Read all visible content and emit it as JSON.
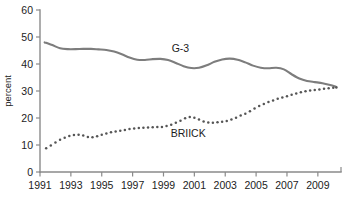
{
  "chart_data": {
    "type": "line",
    "title": "",
    "xlabel": "",
    "ylabel": "percent",
    "ylim": [
      0,
      60
    ],
    "xlim": [
      1991,
      2010.5
    ],
    "yticks": [
      0,
      10,
      20,
      30,
      40,
      50,
      60
    ],
    "ytick_labels": [
      "0",
      "10",
      "20",
      "30",
      "40",
      "50",
      "60"
    ],
    "xticks": [
      1991,
      1993,
      1995,
      1997,
      1999,
      2001,
      2003,
      2005,
      2007,
      2009
    ],
    "xtick_labels": [
      "1991",
      "1993",
      "1995",
      "1997",
      "1999",
      "2001",
      "2003",
      "2005",
      "2007",
      "2009"
    ],
    "grid": false,
    "legend_position": "inline-annotation",
    "series": [
      {
        "name": "G-3",
        "style": "solid-line",
        "color": "#7d7d7d",
        "label_x": 2000.1,
        "label_y": 44.5,
        "x": [
          1991.3,
          1991.8,
          1992.3,
          1992.8,
          1993.3,
          1993.8,
          1994.3,
          1994.8,
          1995.3,
          1995.8,
          1996.3,
          1996.8,
          1997.3,
          1997.8,
          1998.3,
          1998.8,
          1999.3,
          1999.8,
          2000.3,
          2000.8,
          2001.3,
          2001.8,
          2002.3,
          2002.8,
          2003.3,
          2003.8,
          2004.3,
          2004.8,
          2005.3,
          2005.8,
          2006.3,
          2006.8,
          2007.3,
          2007.8,
          2008.3,
          2008.8,
          2009.3,
          2009.8,
          2010.2
        ],
        "y": [
          48.0,
          47.0,
          45.8,
          45.5,
          45.5,
          45.6,
          45.6,
          45.4,
          45.2,
          44.6,
          43.6,
          42.4,
          41.6,
          41.5,
          41.8,
          41.9,
          41.5,
          40.4,
          39.2,
          38.5,
          38.6,
          39.5,
          40.8,
          41.7,
          42.0,
          41.6,
          40.6,
          39.4,
          38.6,
          38.4,
          38.6,
          38.0,
          36.2,
          34.6,
          33.7,
          33.3,
          32.9,
          32.2,
          31.5
        ]
      },
      {
        "name": "BRIICK",
        "style": "dotted",
        "color": "#555555",
        "label_x": 2000.6,
        "label_y": 12.8,
        "x": [
          1991.4,
          1991.7,
          1992.0,
          1992.3,
          1992.6,
          1992.9,
          1993.2,
          1993.5,
          1993.8,
          1994.1,
          1994.4,
          1994.7,
          1995.0,
          1995.3,
          1995.6,
          1995.9,
          1996.2,
          1996.5,
          1996.8,
          1997.1,
          1997.4,
          1997.7,
          1998.0,
          1998.3,
          1998.6,
          1998.9,
          1999.2,
          1999.5,
          1999.8,
          2000.1,
          2000.4,
          2000.7,
          2001.0,
          2001.3,
          2001.6,
          2001.9,
          2002.2,
          2002.5,
          2002.8,
          2003.1,
          2003.4,
          2003.7,
          2004.0,
          2004.3,
          2004.6,
          2004.9,
          2005.2,
          2005.5,
          2005.8,
          2006.1,
          2006.4,
          2006.7,
          2007.0,
          2007.3,
          2007.6,
          2007.9,
          2008.2,
          2008.5,
          2008.8,
          2009.1,
          2009.4,
          2009.7,
          2010.0,
          2010.2
        ],
        "y": [
          8.8,
          9.8,
          10.9,
          11.9,
          12.7,
          13.3,
          13.7,
          13.8,
          13.5,
          13.0,
          12.9,
          13.2,
          13.8,
          14.3,
          14.7,
          15.0,
          15.3,
          15.6,
          15.9,
          16.1,
          16.3,
          16.4,
          16.5,
          16.6,
          16.7,
          16.7,
          17.0,
          17.5,
          18.2,
          19.0,
          19.9,
          20.4,
          20.1,
          19.4,
          18.7,
          18.3,
          18.2,
          18.4,
          18.6,
          18.9,
          19.4,
          20.1,
          20.9,
          21.6,
          22.5,
          23.5,
          24.4,
          25.2,
          25.9,
          26.5,
          27.1,
          27.6,
          28.1,
          28.6,
          29.1,
          29.5,
          29.9,
          30.2,
          30.4,
          30.6,
          30.8,
          31.0,
          31.2,
          31.3
        ]
      }
    ]
  }
}
